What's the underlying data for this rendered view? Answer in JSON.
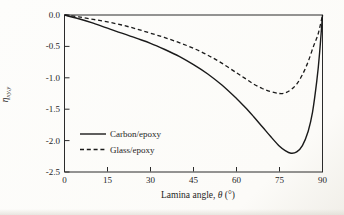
{
  "figure": {
    "background": "#fcfbf8",
    "ink_color": "#1e1e1e",
    "frame_color": "#2b2b2b"
  },
  "chart_data": {
    "type": "line",
    "title": "",
    "xlabel": "Lamina angle, θ (°)",
    "xlabel_parts": {
      "prefix": "Lamina angle, ",
      "symbol": "θ",
      "suffix": " (°)"
    },
    "ylabel": "η_xy,y",
    "ylabel_parts": {
      "symbol": "η",
      "subscript": "xy,y"
    },
    "xlim": [
      0,
      90
    ],
    "ylim": [
      -2.5,
      0
    ],
    "x_ticks": [
      0,
      15,
      30,
      45,
      60,
      75,
      90
    ],
    "x_tick_labels": [
      "0",
      "15",
      "30",
      "45",
      "60",
      "75",
      "90"
    ],
    "y_ticks": [
      0,
      -0.5,
      -1.0,
      -1.5,
      -2.0,
      -2.5
    ],
    "y_tick_labels": [
      "0.0",
      "-0.5",
      "-1.0",
      "-1.5",
      "-2.0",
      "-2.5"
    ],
    "grid": false,
    "legend_position": "inside lower-left",
    "series": [
      {
        "name": "Carbon/epoxy",
        "style": "solid",
        "color": "#1a1a1a",
        "points": [
          [
            0,
            0
          ],
          [
            5,
            -0.06
          ],
          [
            10,
            -0.13
          ],
          [
            15,
            -0.21
          ],
          [
            20,
            -0.29
          ],
          [
            25,
            -0.37
          ],
          [
            30,
            -0.45
          ],
          [
            35,
            -0.55
          ],
          [
            40,
            -0.66
          ],
          [
            45,
            -0.79
          ],
          [
            50,
            -0.94
          ],
          [
            55,
            -1.12
          ],
          [
            60,
            -1.33
          ],
          [
            63,
            -1.47
          ],
          [
            66,
            -1.62
          ],
          [
            69,
            -1.78
          ],
          [
            72,
            -1.94
          ],
          [
            75,
            -2.09
          ],
          [
            77,
            -2.16
          ],
          [
            79,
            -2.2
          ],
          [
            81,
            -2.18
          ],
          [
            83,
            -2.08
          ],
          [
            85,
            -1.85
          ],
          [
            86.5,
            -1.55
          ],
          [
            88,
            -1.05
          ],
          [
            89,
            -0.6
          ],
          [
            90,
            0
          ]
        ]
      },
      {
        "name": "Glass/epoxy",
        "style": "dashed",
        "color": "#1a1a1a",
        "points": [
          [
            0,
            0
          ],
          [
            5,
            -0.03
          ],
          [
            10,
            -0.07
          ],
          [
            15,
            -0.11
          ],
          [
            20,
            -0.16
          ],
          [
            25,
            -0.22
          ],
          [
            30,
            -0.29
          ],
          [
            35,
            -0.36
          ],
          [
            40,
            -0.44
          ],
          [
            45,
            -0.53
          ],
          [
            50,
            -0.64
          ],
          [
            55,
            -0.77
          ],
          [
            60,
            -0.92
          ],
          [
            63,
            -1.01
          ],
          [
            66,
            -1.1
          ],
          [
            69,
            -1.17
          ],
          [
            72,
            -1.22
          ],
          [
            75,
            -1.25
          ],
          [
            77,
            -1.24
          ],
          [
            79,
            -1.19
          ],
          [
            81,
            -1.1
          ],
          [
            83,
            -0.95
          ],
          [
            85,
            -0.74
          ],
          [
            87,
            -0.48
          ],
          [
            88.5,
            -0.3
          ],
          [
            90,
            0
          ]
        ]
      }
    ]
  }
}
